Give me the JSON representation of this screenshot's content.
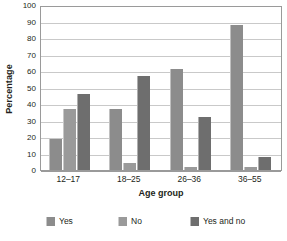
{
  "chart_data": {
    "type": "bar",
    "title": "",
    "xlabel": "Age group",
    "ylabel": "Percentage",
    "categories": [
      "12–17",
      "18–25",
      "26–36",
      "36–55"
    ],
    "series": [
      {
        "name": "Yes",
        "color": "#8c8c8c",
        "values": [
          19,
          37,
          61,
          88
        ]
      },
      {
        "name": "No",
        "color": "#9a9a9a",
        "values": [
          37,
          4,
          2,
          2
        ]
      },
      {
        "name": "Yes and no",
        "color": "#6e6e6e",
        "values": [
          46,
          57,
          32,
          8
        ]
      }
    ],
    "ylim": [
      0,
      100
    ],
    "y_ticks": [
      0,
      10,
      20,
      30,
      40,
      50,
      60,
      70,
      80,
      90,
      100
    ],
    "grid": true,
    "legend_position": "bottom",
    "plot_background": "#ffffff",
    "grid_color": "#c9c9c9",
    "axis_color": "#9a9a9a"
  }
}
